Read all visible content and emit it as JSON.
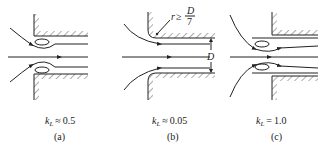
{
  "figure": {
    "panels": [
      {
        "id": "a",
        "caption": "(a)",
        "coef_symbol": "k",
        "coef_sub": "L",
        "relation": "≈",
        "value": "0.5",
        "inlet": "square-edged"
      },
      {
        "id": "b",
        "caption": "(b)",
        "coef_symbol": "k",
        "coef_sub": "L",
        "relation": "≈",
        "value": "0.05",
        "inlet": "well-rounded",
        "radius_annotation": {
          "lhs": "r",
          "op": "≥",
          "num": "D",
          "den": "7"
        },
        "dimension_label": "D"
      },
      {
        "id": "c",
        "caption": "(c)",
        "coef_symbol": "k",
        "coef_sub": "L",
        "relation": "=",
        "value": "1.0",
        "inlet": "reentrant"
      }
    ],
    "colors": {
      "line": "#222222",
      "background": "#ffffff"
    }
  }
}
